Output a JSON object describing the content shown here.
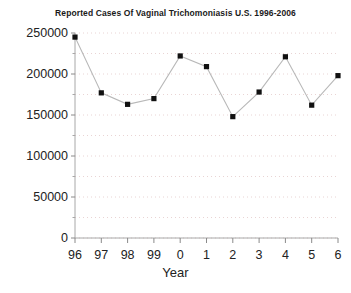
{
  "chart_data": {
    "type": "line",
    "title": "Reported Cases Of Vaginal Trichomoniasis U.S. 1996-2006",
    "xlabel": "Year",
    "ylabel": "",
    "categories": [
      "96",
      "97",
      "98",
      "99",
      "0",
      "1",
      "2",
      "3",
      "4",
      "5",
      "6"
    ],
    "values": [
      245000,
      177000,
      163000,
      170000,
      222000,
      209000,
      148000,
      178000,
      221000,
      162000,
      198000
    ],
    "ylim": [
      0,
      250000
    ],
    "yticks": [
      0,
      50000,
      100000,
      150000,
      200000,
      250000
    ],
    "ytick_labels": [
      "0",
      "50000",
      "100000",
      "150000",
      "200000",
      "250000"
    ],
    "minor_gridline_step": 25000,
    "grid": "horizontal-dotted-minor",
    "legend": "none",
    "marker": "filled-square",
    "line_color": "#b8b8b8",
    "marker_color": "#111111",
    "axis_color": "#999999",
    "grid_color": "#e6cfcf",
    "background": "#ffffff"
  },
  "axes": {
    "y_tick_labels": [
      "250000",
      "200000",
      "150000",
      "100000",
      "50000",
      "0"
    ],
    "x_tick_labels": [
      "96",
      "97",
      "98",
      "99",
      "0",
      "1",
      "2",
      "3",
      "4",
      "5",
      "6"
    ],
    "x_axis_title": "Year"
  }
}
